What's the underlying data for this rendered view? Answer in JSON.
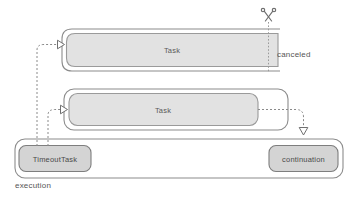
{
  "diagram": {
    "type": "sequence-swimlane",
    "background_color": "#ffffff",
    "colors": {
      "outer_box_fill": "#ffffff",
      "outer_box_stroke": "#8c8c8c",
      "task_fill": "#e2e2e2",
      "task_stroke": "#9a9a9a",
      "node_fill": "#d4d4d4",
      "node_stroke": "#7e7e7e",
      "dashed_line": "#8a8a8a",
      "text": "#4d4d4d"
    }
  },
  "rows": {
    "canceled_task": {
      "label": "Task",
      "side_label": "canceled",
      "cut_icon": "scissors-icon"
    },
    "completed_task": {
      "label": "Task"
    },
    "execution": {
      "label": "execution",
      "timeout_node": "TimeoutTask",
      "continuation_node": "continuation"
    }
  },
  "arrows": [
    {
      "name": "timeout-to-canceled-task",
      "style": "dashed",
      "head": "hollow-triangle-right"
    },
    {
      "name": "timeout-to-completed-task",
      "style": "dashed",
      "head": "hollow-triangle-right"
    },
    {
      "name": "task-to-continuation",
      "style": "dashed",
      "head": "hollow-triangle-down"
    },
    {
      "name": "scissors-cut-line",
      "style": "dotted",
      "head": "none"
    }
  ]
}
